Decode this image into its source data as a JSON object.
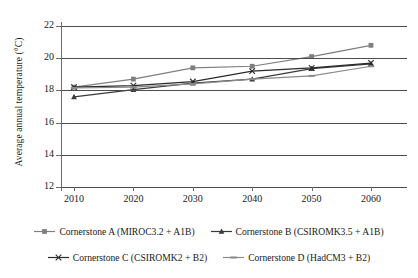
{
  "chart_data": {
    "type": "line",
    "title": "",
    "xlabel": "",
    "ylabel": "Average annual temperature (°C)",
    "categories": [
      2010,
      2020,
      2030,
      2040,
      2050,
      2060
    ],
    "x_tick_labels": [
      "2010",
      "2020",
      "2030",
      "2040",
      "2050",
      "2060"
    ],
    "y_tick_labels": [
      "22",
      "20",
      "18",
      "16",
      "14",
      "12"
    ],
    "y_ticks": [
      22,
      20,
      18,
      16,
      14,
      12
    ],
    "ylim": [
      12,
      22
    ],
    "grid": "horizontal",
    "legend_position": "bottom",
    "series": [
      {
        "name": "Cornerstone A (MIROC3.2 + A1B)",
        "marker": "square",
        "color": "#7f7f7f",
        "values": [
          18.2,
          18.7,
          19.4,
          19.5,
          20.1,
          20.8
        ]
      },
      {
        "name": "Cornerstone B (CSIROMK3.5 + A1B)",
        "marker": "triangle",
        "color": "#3a3a3a",
        "values": [
          17.6,
          18.05,
          18.45,
          18.7,
          19.35,
          19.65
        ]
      },
      {
        "name": "Cornerstone C (CSIROMK2 + B2)",
        "marker": "cross",
        "color": "#2b2b2b",
        "values": [
          18.2,
          18.3,
          18.55,
          19.2,
          19.4,
          19.7
        ]
      },
      {
        "name": "Cornerstone D (HadCM3 + B2)",
        "marker": "dash",
        "color": "#8a8a8a",
        "values": [
          18.15,
          18.2,
          18.4,
          18.7,
          18.9,
          19.5
        ]
      }
    ]
  },
  "legend": {
    "rows": [
      [
        "Cornerstone A (MIROC3.2 + A1B)",
        "Cornerstone B (CSIROMK3.5 + A1B)"
      ],
      [
        "Cornerstone C (CSIROMK2 + B2)",
        "Cornerstone D (HadCM3 + B2)"
      ]
    ]
  }
}
